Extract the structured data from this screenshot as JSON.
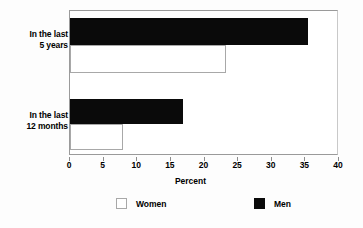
{
  "chart_data": {
    "type": "bar",
    "orientation": "horizontal",
    "title": "",
    "xlabel": "Percent",
    "ylabel": "",
    "xlim": [
      0,
      40
    ],
    "xticks": [
      0,
      5,
      10,
      15,
      20,
      25,
      30,
      35,
      40
    ],
    "xtick_labels": [
      "0",
      "5",
      "10",
      "15",
      "20",
      "25",
      "30",
      "35",
      "40"
    ],
    "grid": false,
    "legend_position": "bottom",
    "categories": [
      "In the last 5 years",
      "In the last 12 months"
    ],
    "category_lines": [
      [
        "In the last",
        "5 years"
      ],
      [
        "In the last",
        "12 months"
      ]
    ],
    "series": [
      {
        "name": "Women",
        "values": [
          23.2,
          7.9
        ],
        "color": "#ffffff",
        "edge_color": "#a8a8a8"
      },
      {
        "name": "Men",
        "values": [
          35.4,
          16.8
        ],
        "color": "#000000",
        "edge_color": "#000000"
      }
    ]
  },
  "axis": {
    "x_title": "Percent",
    "ticks": [
      {
        "value": "0"
      },
      {
        "value": "5"
      },
      {
        "value": "10"
      },
      {
        "value": "15"
      },
      {
        "value": "20"
      },
      {
        "value": "25"
      },
      {
        "value": "30"
      },
      {
        "value": "35"
      },
      {
        "value": "40"
      }
    ]
  },
  "categories": {
    "first": {
      "line1": "In the last",
      "line2": "5 years"
    },
    "second": {
      "line1": "In the last",
      "line2": "12 months"
    }
  },
  "legend": {
    "women_label": "Women",
    "men_label": "Men"
  },
  "colors": {
    "men_fill": "#000000",
    "women_fill": "#ffffff",
    "axis": "#8d8d8d",
    "background": "#ffffff"
  }
}
